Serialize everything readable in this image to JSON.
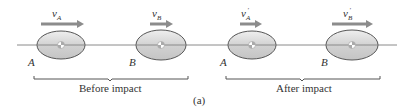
{
  "diagram": {
    "caption": "(a)",
    "line_color": "#8a8a8a",
    "ellipse_fill": "#cfcfcf",
    "ellipse_stroke": "#555555",
    "arrow_color": "#8c8c8c",
    "groups": [
      {
        "label": "Before impact",
        "bodies": [
          {
            "name": "A",
            "velocity_label": "v",
            "velocity_sub": "A",
            "prime": ""
          },
          {
            "name": "B",
            "velocity_label": "v",
            "velocity_sub": "B",
            "prime": ""
          }
        ]
      },
      {
        "label": "After impact",
        "bodies": [
          {
            "name": "A",
            "velocity_label": "v",
            "velocity_sub": "A",
            "prime": "′"
          },
          {
            "name": "B",
            "velocity_label": "v",
            "velocity_sub": "B",
            "prime": "′"
          }
        ]
      }
    ]
  }
}
